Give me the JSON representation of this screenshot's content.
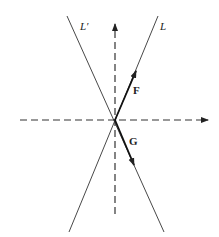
{
  "diagram": {
    "labels": {
      "line_L_prime": "L′",
      "line_L": "L",
      "vector_F": "F",
      "vector_G": "G"
    },
    "colors": {
      "ink": "#222222",
      "background": "#ffffff"
    }
  }
}
